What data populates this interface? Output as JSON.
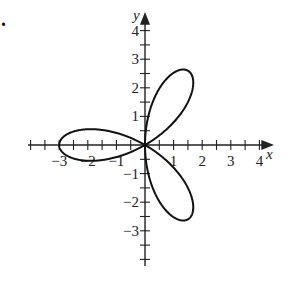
{
  "problem_marker": ".",
  "chart_data": {
    "type": "line",
    "title": "",
    "equation": "r = -3cos(3θ)",
    "xlabel": "x",
    "ylabel": "y",
    "xlim": [
      -4,
      4
    ],
    "ylim": [
      -4,
      4
    ],
    "x_ticks": [
      -3,
      -2,
      -1,
      1,
      2,
      3,
      4
    ],
    "y_ticks": [
      4,
      3,
      2,
      1,
      -1,
      -2,
      -3
    ],
    "x_tick_labels": [
      "−3",
      "−2",
      "−1",
      "1",
      "2",
      "3",
      "4"
    ],
    "y_tick_labels": [
      "4",
      "3",
      "2",
      "1",
      "−1",
      "−2",
      "−3"
    ],
    "minor_tick_step": 0.5,
    "grid": false,
    "petal_tips": [
      {
        "x": -3.0,
        "y": 0.0
      },
      {
        "x": 1.5,
        "y": 2.6
      },
      {
        "x": 1.5,
        "y": -2.6
      }
    ],
    "petal_length": 3,
    "stroke_color": "#111111"
  },
  "layout": {
    "origin_px": [
      145,
      145
    ],
    "unit_px": 28.6,
    "x_axis_px": [
      28,
      272
    ],
    "y_axis_px": [
      14,
      266
    ]
  }
}
